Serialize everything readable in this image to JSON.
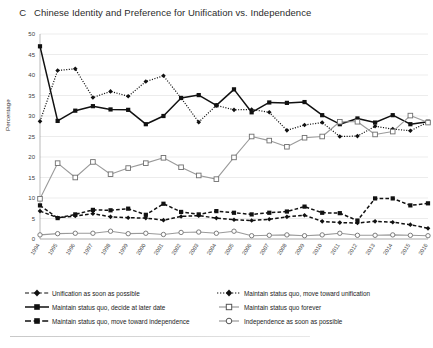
{
  "figure": {
    "panel_letter": "C",
    "title": "Chinese Identity and Preference for Unification vs. Independence"
  },
  "chart_data": {
    "type": "line",
    "title": "Chinese Identity and Preference for Unification vs. Independence",
    "xlabel": "",
    "ylabel": "Percentage",
    "ylim": [
      0,
      50
    ],
    "ytick_step": 5,
    "yticks": [
      "0",
      "5",
      "10",
      "15",
      "20",
      "25",
      "30",
      "35",
      "40",
      "45",
      "50"
    ],
    "grid": true,
    "legend_position": "below-plot",
    "categories": [
      "1994",
      "1995",
      "1996",
      "1997",
      "1998",
      "1999",
      "2000",
      "2001",
      "2002",
      "2003",
      "2004",
      "2005",
      "2006",
      "2007",
      "2008",
      "2009",
      "2010",
      "2011",
      "2012",
      "2013",
      "2014",
      "2015",
      "2016"
    ],
    "series": [
      {
        "name": "Unification as soon as possible",
        "style": "dashed",
        "marker": "diamond-filled",
        "color": "#111111",
        "values": [
          6.8,
          5.2,
          5.6,
          6.2,
          5.4,
          5.2,
          5.1,
          4.6,
          5.5,
          5.7,
          5.1,
          4.7,
          4.5,
          4.8,
          5.4,
          5.8,
          4.3,
          4.0,
          3.9,
          4.3,
          4.1,
          3.5,
          2.6
        ]
      },
      {
        "name": "Maintain status quo, decide at later date",
        "style": "solid",
        "marker": "square-filled",
        "color": "#111111",
        "values": [
          47.0,
          28.8,
          31.3,
          32.4,
          31.6,
          31.5,
          28.0,
          30.0,
          34.4,
          35.1,
          32.6,
          36.5,
          30.9,
          33.3,
          33.2,
          33.4,
          30.2,
          28.0,
          29.4,
          28.4,
          30.2,
          28.0,
          28.6
        ]
      },
      {
        "name": "Maintain status quo, move toward independence",
        "style": "dashed",
        "marker": "square-filled",
        "color": "#111111",
        "values": [
          8.2,
          5.1,
          6.0,
          7.1,
          7.0,
          7.4,
          5.9,
          8.6,
          6.6,
          6.0,
          6.8,
          6.4,
          6.0,
          6.4,
          6.7,
          7.9,
          6.4,
          6.3,
          4.5,
          9.9,
          9.9,
          8.2,
          8.7
        ]
      },
      {
        "name": "Maintain status quo, move toward unification",
        "style": "dotted",
        "marker": "diamond-filled",
        "color": "#111111",
        "values": [
          28.7,
          41.1,
          41.5,
          34.5,
          36.0,
          34.8,
          38.4,
          39.8,
          34.4,
          28.5,
          32.6,
          31.5,
          31.6,
          30.9,
          26.5,
          27.8,
          28.4,
          25.0,
          25.1,
          27.5,
          26.8,
          26.4,
          28.5
        ]
      },
      {
        "name": "Maintain status quo forever",
        "style": "solid",
        "marker": "square-open",
        "color": "#9a9a9a",
        "values": [
          9.8,
          18.5,
          15.0,
          18.8,
          15.8,
          17.3,
          18.5,
          19.8,
          17.5,
          15.5,
          14.6,
          19.9,
          25.0,
          24.0,
          22.5,
          24.7,
          25.0,
          28.6,
          28.6,
          25.5,
          26.2,
          30.1,
          28.4
        ]
      },
      {
        "name": "Independence as soon as possible",
        "style": "solid",
        "marker": "circle-open",
        "color": "#9a9a9a",
        "values": [
          1.0,
          1.3,
          1.4,
          1.4,
          1.9,
          1.3,
          1.4,
          1.1,
          1.6,
          1.7,
          1.4,
          1.9,
          0.8,
          0.9,
          1.0,
          0.8,
          1.0,
          1.4,
          0.9,
          0.9,
          1.0,
          0.9,
          0.8
        ]
      }
    ]
  },
  "legend": {
    "left_items": [
      {
        "label": "Unification as soon as possible",
        "key": "dashed-diamond-black"
      },
      {
        "label": "Maintain status quo, decide at later date",
        "key": "solid-square-black"
      },
      {
        "label": "Maintain status quo, move toward independence",
        "key": "dashed-square-black"
      }
    ],
    "right_items": [
      {
        "label": "Maintain status quo, move toward unification",
        "key": "dotted-diamond-black"
      },
      {
        "label": "Maintain status quo forever",
        "key": "solid-square-open-gray"
      },
      {
        "label": "Independence as soon as possible",
        "key": "solid-circle-open-gray"
      }
    ]
  }
}
